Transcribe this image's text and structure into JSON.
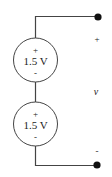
{
  "diagram": {
    "type": "circuit",
    "colors": {
      "wire": "#444444",
      "terminal": "#111111",
      "text": "#222222"
    },
    "sources": [
      {
        "id": "source-1",
        "value": "1.5 V",
        "plus": "+",
        "minus": "-"
      },
      {
        "id": "source-2",
        "value": "1.5 V",
        "plus": "+",
        "minus": "-"
      }
    ],
    "output": {
      "plus": "+",
      "voltage_label": "v",
      "minus": "-"
    }
  }
}
